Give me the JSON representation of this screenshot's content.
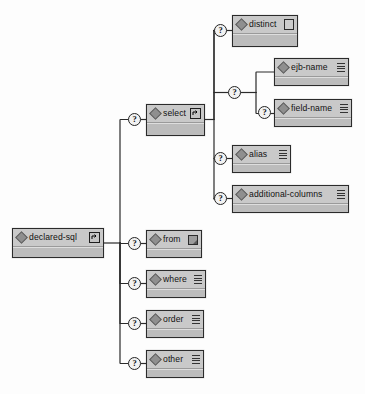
{
  "diagram": {
    "kind": "xml-schema-tree",
    "title": "declared-sql",
    "background_color": "#fdfdfd",
    "node_fill_top": "#c9c9c9",
    "node_fill_base": "#bcbcbc",
    "node_border_color": "#2b2b2b",
    "connector_color": "#2b2b2b",
    "optional_marker_glyph": "?"
  },
  "nodes": [
    {
      "id": "declared-sql",
      "label": "declared-sql",
      "element_icon": "diamond-element-icon",
      "right_control": "expander",
      "right_control_icon": "expand-collapse-icon",
      "optional": false,
      "x": 12,
      "y": 228,
      "w": 92,
      "h": 30
    },
    {
      "id": "select",
      "label": "select",
      "element_icon": "diamond-element-icon",
      "right_control": "expander",
      "right_control_icon": "expand-collapse-icon",
      "optional": true,
      "x": 146,
      "y": 104,
      "w": 59,
      "h": 32
    },
    {
      "id": "distinct",
      "label": "distinct",
      "element_icon": "diamond-element-icon",
      "right_control": "emptybox",
      "right_control_icon": "empty-rect-icon",
      "optional": true,
      "x": 232,
      "y": 15,
      "w": 66,
      "h": 32
    },
    {
      "id": "ejb-name",
      "label": "ejb-name",
      "element_icon": "diamond-element-icon",
      "right_control": "lines",
      "right_control_icon": "text-lines-icon",
      "optional": false,
      "x": 274,
      "y": 58,
      "w": 75,
      "h": 28
    },
    {
      "id": "field-name",
      "label": "field-name",
      "element_icon": "diamond-element-icon",
      "right_control": "lines",
      "right_control_icon": "text-lines-icon",
      "optional": true,
      "x": 274,
      "y": 99,
      "w": 78,
      "h": 28
    },
    {
      "id": "alias",
      "label": "alias",
      "element_icon": "diamond-element-icon",
      "right_control": "lines",
      "right_control_icon": "text-lines-icon",
      "optional": true,
      "x": 232,
      "y": 145,
      "w": 59,
      "h": 28
    },
    {
      "id": "additional-columns",
      "label": "additional-columns",
      "element_icon": "diamond-element-icon",
      "right_control": "lines",
      "right_control_icon": "text-lines-icon",
      "optional": true,
      "x": 232,
      "y": 185,
      "w": 117,
      "h": 28
    },
    {
      "id": "from",
      "label": "from",
      "element_icon": "diamond-element-icon",
      "right_control": "folded",
      "right_control_icon": "folded-square-icon",
      "optional": true,
      "x": 146,
      "y": 230,
      "w": 56,
      "h": 28
    },
    {
      "id": "where",
      "label": "where",
      "element_icon": "diamond-element-icon",
      "right_control": "lines",
      "right_control_icon": "text-lines-icon",
      "optional": true,
      "x": 146,
      "y": 270,
      "w": 60,
      "h": 28
    },
    {
      "id": "order",
      "label": "order",
      "element_icon": "diamond-element-icon",
      "right_control": "lines",
      "right_control_icon": "text-lines-icon",
      "optional": true,
      "x": 146,
      "y": 310,
      "w": 58,
      "h": 28
    },
    {
      "id": "other",
      "label": "other",
      "element_icon": "diamond-element-icon",
      "right_control": "lines",
      "right_control_icon": "text-lines-icon",
      "optional": true,
      "x": 146,
      "y": 350,
      "w": 58,
      "h": 28
    }
  ],
  "optional_markers": [
    {
      "for": "select",
      "x": 128,
      "y": 113
    },
    {
      "for": "distinct",
      "x": 214,
      "y": 24
    },
    {
      "for": "name-choice",
      "x": 228,
      "y": 86
    },
    {
      "for": "field-name",
      "x": 258,
      "y": 106
    },
    {
      "for": "alias",
      "x": 214,
      "y": 152
    },
    {
      "for": "additional-columns",
      "x": 214,
      "y": 192
    },
    {
      "for": "from",
      "x": 128,
      "y": 237
    },
    {
      "for": "where",
      "x": 128,
      "y": 277
    },
    {
      "for": "order",
      "x": 128,
      "y": 317
    },
    {
      "for": "other",
      "x": 128,
      "y": 357
    }
  ]
}
